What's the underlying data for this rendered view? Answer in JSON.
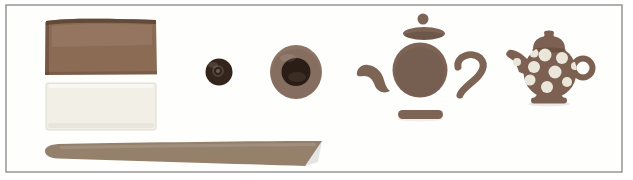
{
  "scene": {
    "alt": "Step-by-step clay craft photo strip: brown and white clay slabs with a long tapered clay rod, a small dark clay ball, a flattened ball hollowed in the centre, unassembled teapot pieces (lid knob, lid, body, spout, handle, base), and a finished brown teapot decorated with white polka dots",
    "background": "#ffffff",
    "frame": {
      "fill": "#fefefd",
      "stroke": "#8f8f8f"
    },
    "items": {
      "brown_slab": {
        "label": "brown clay slab",
        "fill": "#8b6b54",
        "edge": "#5c4334"
      },
      "white_slab": {
        "label": "white clay slab",
        "fill": "#f1efe6",
        "edge": "#d9d6c8"
      },
      "clay_rod": {
        "label": "long tapered clay rod",
        "fill": "#95806c"
      },
      "small_ball": {
        "label": "small dark clay ball",
        "fill": "#33241c",
        "center": "#6f5d50",
        "ring": "#5f4d41"
      },
      "pinch_pot": {
        "label": "flattened clay ball with hollowed centre",
        "fill": "#8e7465",
        "hollow": "#291d16",
        "hollow_sheen": "#4d392c"
      },
      "teapot_parts": {
        "label": "unassembled teapot pieces",
        "fill": "#7d6455"
      },
      "finished_teapot": {
        "label": "finished polka-dot teapot",
        "fill": "#7c6052",
        "shade": "#66503f",
        "dot_fill": "#ebe6da",
        "spout_dot": {
          "cx": 517,
          "cy": 62,
          "r": 4
        },
        "dots": [
          {
            "cx": 534,
            "cy": 53,
            "r": 4.5
          },
          {
            "cx": 545,
            "cy": 55,
            "r": 6.5
          },
          {
            "cx": 562,
            "cy": 58,
            "r": 6
          },
          {
            "cx": 534,
            "cy": 67,
            "r": 6
          },
          {
            "cx": 555,
            "cy": 72,
            "r": 6.5
          },
          {
            "cx": 575,
            "cy": 66,
            "r": 4
          },
          {
            "cx": 530,
            "cy": 80,
            "r": 5.5
          },
          {
            "cx": 547,
            "cy": 87,
            "r": 6
          },
          {
            "cx": 567,
            "cy": 82,
            "r": 5
          }
        ]
      }
    }
  }
}
